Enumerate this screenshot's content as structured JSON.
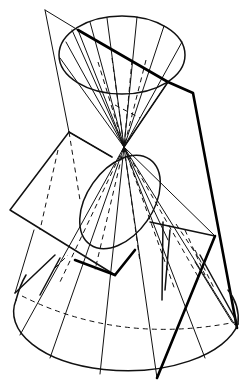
{
  "figure": {
    "apex": [
      124,
      147
    ],
    "colors": {
      "ink": "#111111",
      "background": "#ffffff"
    },
    "upper_cone": {
      "ellipse": {
        "cx": 122,
        "cy": 55,
        "rx": 63,
        "ry": 39
      },
      "generators_top": [
        [
          72,
          28
        ],
        [
          88,
          20
        ],
        [
          107,
          17
        ],
        [
          137,
          17
        ],
        [
          163,
          23
        ],
        [
          182,
          42
        ],
        [
          66,
          40
        ],
        [
          170,
          70
        ]
      ],
      "hidden_generators_top": [
        [
          112,
          62
        ],
        [
          135,
          65
        ],
        [
          150,
          60
        ],
        [
          97,
          60
        ]
      ]
    },
    "lower_cone": {
      "ellipse": {
        "cx": 127,
        "cy": 320,
        "rx": 112,
        "ry": 58
      },
      "generators_bottom": [
        [
          20,
          335
        ],
        [
          50,
          356
        ],
        [
          100,
          373
        ],
        [
          157,
          378
        ],
        [
          200,
          360
        ],
        [
          235,
          325
        ],
        [
          207,
          282
        ]
      ],
      "hidden_generators_bottom": [
        [
          22,
          293
        ],
        [
          60,
          278
        ],
        [
          120,
          275
        ],
        [
          175,
          285
        ],
        [
          230,
          305
        ]
      ]
    },
    "planes": [
      {
        "name": "hyperbola-plane",
        "points": [
          [
            45,
            10
          ],
          [
            69,
            132
          ],
          [
            15,
            293
          ]
        ]
      },
      {
        "name": "ellipse-plane",
        "points": [
          [
            69,
            132
          ],
          [
            112,
            157
          ],
          [
            215,
            236
          ],
          [
            115,
            275
          ],
          [
            10,
            210
          ]
        ]
      },
      {
        "name": "parabola-plane-edge",
        "points": [
          [
            78,
            30
          ],
          [
            193,
            93
          ],
          [
            237,
            328
          ]
        ]
      }
    ]
  }
}
